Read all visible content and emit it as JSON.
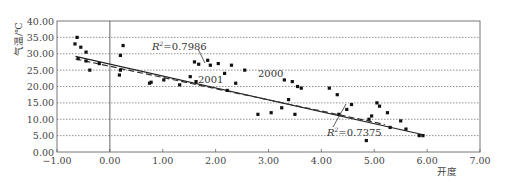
{
  "chart_data": {
    "type": "scatter",
    "title": "",
    "xlabel": "开度",
    "ylabel": "气温/℃",
    "xlim": [
      -1.0,
      7.0
    ],
    "ylim": [
      0.0,
      40.0
    ],
    "x_ticks": [
      "-1.00",
      "0.00",
      "1.00",
      "2.00",
      "3.00",
      "4.00",
      "5.00",
      "6.00",
      "7.00"
    ],
    "y_ticks": [
      "0.00",
      "5.00",
      "10.00",
      "15.00",
      "20.00",
      "25.00",
      "30.00",
      "35.00",
      "40.00"
    ],
    "grid": "horizontal dotted",
    "series": [
      {
        "name": "2000",
        "style": "points",
        "points": [
          [
            -0.62,
            35.0
          ],
          [
            -0.66,
            33.0
          ],
          [
            -0.55,
            32.0
          ],
          [
            -0.45,
            30.5
          ],
          [
            -0.6,
            28.5
          ],
          [
            -0.45,
            27.8
          ],
          [
            -0.38,
            25.0
          ],
          [
            -0.2,
            27.0
          ],
          [
            0.2,
            29.5
          ],
          [
            0.25,
            32.5
          ],
          [
            0.2,
            25.0
          ],
          [
            0.18,
            23.5
          ],
          [
            0.75,
            21.0
          ],
          [
            0.78,
            21.3
          ],
          [
            1.02,
            22.0
          ],
          [
            1.32,
            20.5
          ],
          [
            1.6,
            27.5
          ],
          [
            1.68,
            26.8
          ],
          [
            1.52,
            23.0
          ],
          [
            1.63,
            21.5
          ],
          [
            1.85,
            28.0
          ],
          [
            1.9,
            26.5
          ],
          [
            2.05,
            27.0
          ],
          [
            2.3,
            26.5
          ],
          [
            2.17,
            24.0
          ],
          [
            2.38,
            21.0
          ],
          [
            2.22,
            18.8
          ],
          [
            2.55,
            25.0
          ],
          [
            2.8,
            11.5
          ],
          [
            3.05,
            12.0
          ],
          [
            3.3,
            22.0
          ],
          [
            3.45,
            21.5
          ],
          [
            3.55,
            20.0
          ],
          [
            3.62,
            19.5
          ],
          [
            3.38,
            16.0
          ],
          [
            3.25,
            13.5
          ],
          [
            3.5,
            11.5
          ],
          [
            4.15,
            19.5
          ],
          [
            4.3,
            17.5
          ],
          [
            4.33,
            11.5
          ],
          [
            4.48,
            13.0
          ],
          [
            4.57,
            14.5
          ],
          [
            4.9,
            10.0
          ],
          [
            5.05,
            15.0
          ],
          [
            5.1,
            14.0
          ],
          [
            4.95,
            11.0
          ],
          [
            5.25,
            12.0
          ],
          [
            4.85,
            3.5
          ],
          [
            5.3,
            7.5
          ],
          [
            5.5,
            9.5
          ],
          [
            5.6,
            7.0
          ],
          [
            5.85,
            5.0
          ],
          [
            5.92,
            5.0
          ]
        ]
      },
      {
        "name": "2000 trend",
        "style": "solid",
        "line": [
          [
            -0.65,
            29.2
          ],
          [
            5.95,
            5.2
          ]
        ],
        "r2": "R²=0.7375"
      },
      {
        "name": "2001 trend",
        "style": "dashed",
        "line": [
          [
            -0.65,
            28.4
          ],
          [
            5.2,
            8.4
          ]
        ],
        "r2": "R²=0.7986"
      }
    ],
    "annotations": [
      {
        "text": "R²=0.7986",
        "x": 1.5,
        "y": 32.3
      },
      {
        "text": "2001",
        "x": 1.45,
        "y": 22.0
      },
      {
        "text": "2000",
        "x": 2.8,
        "y": 24.5
      },
      {
        "text": "R²=0.7375",
        "x": 3.7,
        "y": 6.0
      }
    ],
    "legend": "none (inline labels)"
  },
  "labels": {
    "ylabel": "气温/℃",
    "xlabel": "开度",
    "r2_a_prefix": "R",
    "r2_a_value": "=0.7986",
    "r2_b_prefix": "R",
    "r2_b_value": "=0.7375",
    "sup": "2",
    "lbl_2001": "2001",
    "lbl_2000": "2000"
  }
}
